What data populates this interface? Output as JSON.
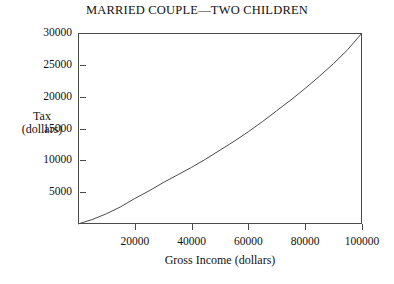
{
  "chart_data": {
    "type": "line",
    "title": "MARRIED COUPLE—TWO CHILDREN",
    "xlabel": "Gross Income (dollars)",
    "ylabel_line1": "Tax",
    "ylabel_line2": "(dollars)",
    "xlim": [
      0,
      100000
    ],
    "ylim": [
      0,
      30000
    ],
    "grid": false,
    "legend": "none",
    "xticks": [
      20000,
      40000,
      60000,
      80000,
      100000
    ],
    "xtick_labels": [
      "20000",
      "40000",
      "60000",
      "80000",
      "100000"
    ],
    "yticks": [
      5000,
      10000,
      15000,
      20000,
      25000,
      30000
    ],
    "ytick_labels": [
      "5000",
      "10000",
      "15000",
      "20000",
      "25000",
      "30000"
    ],
    "series": [
      {
        "name": "Tax owed",
        "x": [
          0,
          5000,
          10000,
          15000,
          20000,
          25000,
          30000,
          35000,
          40000,
          45000,
          50000,
          55000,
          60000,
          65000,
          70000,
          75000,
          80000,
          85000,
          90000,
          95000,
          100000
        ],
        "y": [
          0,
          700,
          1600,
          2700,
          4000,
          5200,
          6500,
          7700,
          8900,
          10200,
          11600,
          13000,
          14500,
          16100,
          17800,
          19500,
          21300,
          23200,
          25200,
          27400,
          30000
        ]
      }
    ]
  },
  "figure": {
    "background_color": "#ffffff",
    "line_color": "#4a4a4a",
    "axis_color": "#4a4a4a",
    "text_color": "#111111"
  }
}
